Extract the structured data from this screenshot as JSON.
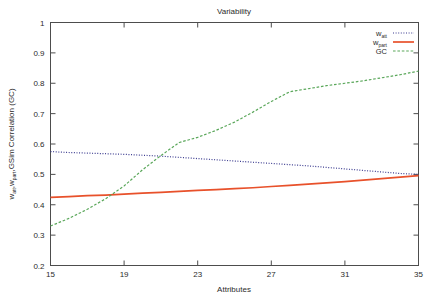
{
  "chart_data": {
    "type": "line",
    "title": "Variability",
    "xlabel": "Attributes",
    "ylabel": "w_att, w_part, GSim Correlation (GC)",
    "ylabel_display": "w",
    "ylabel_sub1": "att",
    "ylabel_mid": ",w",
    "ylabel_sub2": "part",
    "ylabel_tail": ",GSim Correlation (GC)",
    "xlim": [
      15,
      35
    ],
    "ylim": [
      0.2,
      1.0
    ],
    "xticks": [
      15,
      19,
      23,
      27,
      31,
      35
    ],
    "xtick_labels": [
      "15",
      "19",
      "23",
      "27",
      "31",
      "35"
    ],
    "yticks": [
      0.2,
      0.3,
      0.4,
      0.5,
      0.6,
      0.7,
      0.8,
      0.9,
      1.0
    ],
    "ytick_labels": [
      "0.2",
      "0.3",
      "0.4",
      "0.5",
      "0.6",
      "0.7",
      "0.8",
      "0.9",
      "1"
    ],
    "grid": false,
    "legend_position": "top-right",
    "x": [
      15,
      16,
      17,
      18,
      19,
      20,
      21,
      22,
      23,
      24,
      25,
      26,
      27,
      28,
      29,
      30,
      31,
      32,
      33,
      34,
      35
    ],
    "series": [
      {
        "name": "w_att",
        "label_main": "w",
        "label_sub": "att",
        "style": "dotted",
        "color": "#3b3b8f",
        "values": [
          0.575,
          0.572,
          0.57,
          0.568,
          0.566,
          0.563,
          0.56,
          0.556,
          0.552,
          0.548,
          0.544,
          0.54,
          0.536,
          0.532,
          0.528,
          0.523,
          0.518,
          0.513,
          0.508,
          0.503,
          0.5
        ]
      },
      {
        "name": "w_part",
        "label_main": "w",
        "label_sub": "part",
        "style": "solid",
        "color": "#e8512b",
        "values": [
          0.424,
          0.427,
          0.43,
          0.432,
          0.435,
          0.438,
          0.441,
          0.444,
          0.447,
          0.45,
          0.453,
          0.456,
          0.46,
          0.464,
          0.468,
          0.472,
          0.476,
          0.481,
          0.486,
          0.491,
          0.496
        ]
      },
      {
        "name": "GC",
        "label_main": "GC",
        "label_sub": "",
        "style": "dashed",
        "color": "#5aa75a",
        "values": [
          0.33,
          0.355,
          0.385,
          0.42,
          0.462,
          0.515,
          0.562,
          0.605,
          0.622,
          0.645,
          0.672,
          0.705,
          0.74,
          0.772,
          0.782,
          0.792,
          0.8,
          0.808,
          0.818,
          0.828,
          0.84
        ]
      }
    ]
  },
  "colors": {
    "w_att": "#3b3b8f",
    "w_part": "#e8512b",
    "gc": "#5aa75a",
    "axis": "#4d4d4d",
    "text": "#2b2b2b",
    "background": "#ffffff"
  }
}
